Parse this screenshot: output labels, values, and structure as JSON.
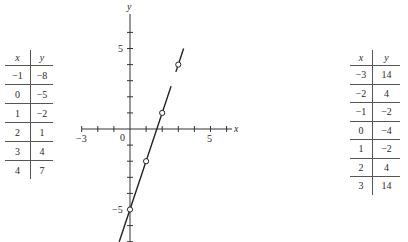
{
  "tables": {
    "left": {
      "headers": [
        "x",
        "y"
      ],
      "rows": [
        [
          "−1",
          "−8"
        ],
        [
          "0",
          "−5"
        ],
        [
          "1",
          "−2"
        ],
        [
          "2",
          "1"
        ],
        [
          "3",
          "4"
        ],
        [
          "4",
          "7"
        ]
      ]
    },
    "right": {
      "headers": [
        "x",
        "y"
      ],
      "rows": [
        [
          "−3",
          "14"
        ],
        [
          "−2",
          "4"
        ],
        [
          "−1",
          "−2"
        ],
        [
          "0",
          "−4"
        ],
        [
          "1",
          "−2"
        ],
        [
          "2",
          "4"
        ],
        [
          "3",
          "14"
        ]
      ]
    }
  },
  "chart_data": {
    "type": "line",
    "title": "",
    "xlabel": "x",
    "ylabel": "y",
    "xlim": [
      -3,
      6.3
    ],
    "ylim": [
      -7,
      7
    ],
    "grid": false,
    "x_tick_labels": [
      "−3",
      "0",
      "5"
    ],
    "y_tick_labels": [
      "5",
      "−5"
    ],
    "series": [
      {
        "name": "y = 3x − 5",
        "line": {
          "x": [
            -0.67,
            3.33
          ],
          "y": [
            -7,
            5
          ]
        },
        "marked_points": {
          "x": [
            0,
            1,
            2,
            3
          ],
          "y": [
            -5,
            -2,
            1,
            4
          ]
        }
      }
    ],
    "axis_labels": {
      "x": "x",
      "y": "y",
      "origin": "0"
    }
  }
}
